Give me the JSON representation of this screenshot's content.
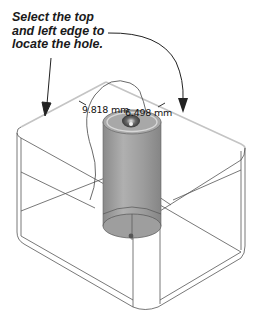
{
  "callout": {
    "lines": [
      "Select the top",
      "and left edge to",
      "locate the hole."
    ]
  },
  "dimensions": {
    "left_edge": "9.818 mm",
    "top_edge": "6.498 mm"
  },
  "colors": {
    "edge_line": "#555555",
    "highlight_edge": "#c8c8c8",
    "cylinder_fill": "#9a9a9a",
    "arrow": "#222222",
    "text": "#1a1a1a"
  }
}
